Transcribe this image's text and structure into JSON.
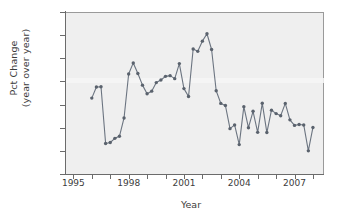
{
  "chart_data": {
    "type": "line",
    "title": "",
    "xlabel": "Year",
    "ylabel_line1": "Pct Change",
    "ylabel_line2": "(year over year)",
    "xlim": [
      1994.6,
      2008.6
    ],
    "ylim": [
      -10,
      60
    ],
    "yticks": [
      -10,
      0,
      10,
      20,
      30,
      40,
      50,
      60
    ],
    "ytick_labels": [
      "−10",
      "0",
      "10",
      "20",
      "30",
      "40",
      "50",
      "60"
    ],
    "xticks": [
      1995,
      1996,
      1997,
      1998,
      1999,
      2000,
      2001,
      2002,
      2003,
      2004,
      2005,
      2006,
      2007,
      2008
    ],
    "xtick_labels": [
      "1995",
      "",
      "",
      "1998",
      "",
      "",
      "2001",
      "",
      "",
      "2004",
      "",
      "",
      "2007",
      ""
    ],
    "xtick_labels_shown": [
      "1995",
      "1998",
      "2001",
      "2004",
      "2007"
    ],
    "grid": false,
    "legend": false,
    "marker": "circle",
    "line_color": "#6b7480",
    "marker_color": "#5a626d",
    "panel_color": "#efefef",
    "series": [
      {
        "name": "Pct Change (year over year)",
        "x": [
          1996.0,
          1996.25,
          1996.5,
          1996.75,
          1997.0,
          1997.25,
          1997.5,
          1997.75,
          1998.0,
          1998.25,
          1998.5,
          1998.75,
          1999.0,
          1999.25,
          1999.5,
          1999.75,
          2000.0,
          2000.25,
          2000.5,
          2000.75,
          2001.0,
          2001.25,
          2001.5,
          2001.75,
          2002.0,
          2002.25,
          2002.5,
          2002.75,
          2003.0,
          2003.25,
          2003.5,
          2003.75,
          2004.0,
          2004.25,
          2004.5,
          2004.75,
          2005.0,
          2005.25,
          2005.5,
          2005.75,
          2006.0,
          2006.25,
          2006.5,
          2006.75,
          2007.0,
          2007.25,
          2007.5,
          2007.75,
          2008.0
        ],
        "values": [
          22.8,
          27.6,
          27.7,
          3.2,
          3.6,
          5.4,
          6.3,
          14.2,
          33.2,
          38.0,
          33.4,
          28.4,
          24.7,
          25.8,
          29.5,
          30.6,
          32.2,
          32.5,
          31.2,
          37.7,
          26.9,
          23.5,
          44.0,
          43.0,
          47.4,
          50.6,
          43.8,
          26.0,
          20.5,
          19.6,
          9.6,
          11.2,
          2.7,
          19.1,
          10.0,
          17.1,
          8.0,
          20.6,
          7.9,
          17.6,
          16.1,
          15.2,
          20.5,
          13.4,
          11.0,
          11.4,
          11.2,
          0.0,
          10.1
        ]
      }
    ]
  }
}
